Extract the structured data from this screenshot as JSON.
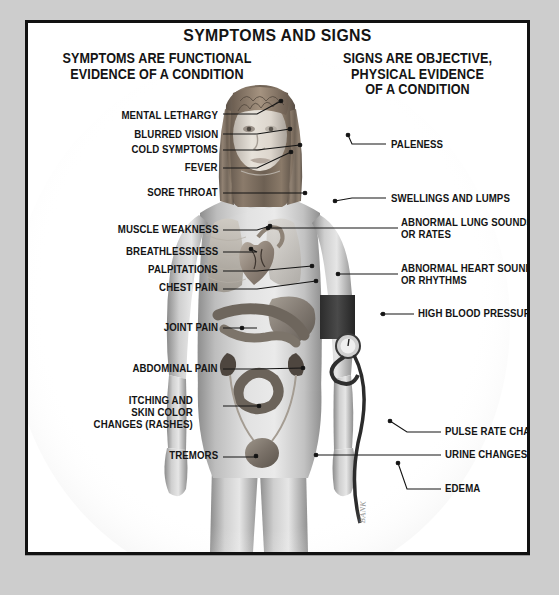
{
  "poster": {
    "title": "SYMPTOMS AND SIGNS",
    "heading_left": "SYMPTOMS ARE FUNCTIONAL\nEVIDENCE OF A CONDITION",
    "heading_right": "SIGNS ARE OBJECTIVE,\nPHYSICAL EVIDENCE\nOF A CONDITION",
    "signature": "BANK",
    "background_color": "#cdcdcd",
    "plate_color": "#ffffff",
    "frame_color": "#111111",
    "text_color": "#141414"
  },
  "symptoms": [
    {
      "label": "MENTAL LETHARGY",
      "x": 190,
      "y": 94,
      "lx": 195,
      "ly": 91,
      "tx": 253,
      "ty": 78
    },
    {
      "label": "BLURRED VISION",
      "x": 190,
      "y": 113,
      "lx": 195,
      "ly": 111,
      "tx": 262,
      "ty": 106
    },
    {
      "label": "COLD SYMPTOMS",
      "x": 190,
      "y": 128,
      "lx": 195,
      "ly": 127,
      "tx": 272,
      "ty": 122
    },
    {
      "label": "FEVER",
      "x": 190,
      "y": 146,
      "lx": 195,
      "ly": 145,
      "tx": 263,
      "ty": 129
    },
    {
      "label": "SORE THROAT",
      "x": 190,
      "y": 171,
      "lx": 195,
      "ly": 170,
      "tx": 277,
      "ty": 170
    },
    {
      "label": "MUSCLE WEAKNESS",
      "x": 190,
      "y": 208,
      "lx": 195,
      "ly": 207,
      "tx": 242,
      "ty": 203
    },
    {
      "label": "BREATHLESSNESS",
      "x": 190,
      "y": 230,
      "lx": 195,
      "ly": 229,
      "tx": 223,
      "ty": 226
    },
    {
      "label": "PALPITATIONS",
      "x": 190,
      "y": 248,
      "lx": 195,
      "ly": 248,
      "tx": 284,
      "ty": 243
    },
    {
      "label": "CHEST PAIN",
      "x": 190,
      "y": 266,
      "lx": 195,
      "ly": 266,
      "tx": 288,
      "ty": 258
    },
    {
      "label": "JOINT PAIN",
      "x": 190,
      "y": 306,
      "lx": 195,
      "ly": 305,
      "tx": 214,
      "ty": 305
    },
    {
      "label": "ABDOMINAL PAIN",
      "x": 190,
      "y": 347,
      "lx": 195,
      "ly": 346,
      "tx": 275,
      "ty": 345
    },
    {
      "label": "ITCHING AND\nSKIN COLOR\nCHANGES (RASHES)",
      "x": 165,
      "y": 379,
      "lx": 195,
      "ly": 383,
      "tx": 231,
      "ty": 383
    },
    {
      "label": "TREMORS",
      "x": 190,
      "y": 434,
      "lx": 195,
      "ly": 434,
      "tx": 228,
      "ty": 433
    }
  ],
  "signs": [
    {
      "label": "PALENESS",
      "x": 363,
      "y": 123,
      "lx": 358,
      "ly": 121,
      "tx": 320,
      "ty": 112
    },
    {
      "label": "SWELLINGS AND LUMPS",
      "x": 363,
      "y": 177,
      "lx": 358,
      "ly": 175,
      "tx": 307,
      "ty": 178
    },
    {
      "label": "ABNORMAL LUNG SOUNDS\nOR RATES",
      "x": 373,
      "y": 201,
      "lx": 370,
      "ly": 205,
      "tx": 240,
      "ty": 205
    },
    {
      "label": "ABNORMAL HEART SOUNDS\nOR RHYTHMS",
      "x": 373,
      "y": 247,
      "lx": 370,
      "ly": 251,
      "tx": 310,
      "ty": 251
    },
    {
      "label": "HIGH BLOOD PRESSURE",
      "x": 390,
      "y": 292,
      "lx": 386,
      "ly": 291,
      "tx": 355,
      "ty": 291
    },
    {
      "label": "PULSE RATE CHANGES",
      "x": 417,
      "y": 410,
      "lx": 413,
      "ly": 409,
      "tx": 362,
      "ty": 398
    },
    {
      "label": "URINE CHANGES",
      "x": 417,
      "y": 433,
      "lx": 413,
      "ly": 432,
      "tx": 288,
      "ty": 432
    },
    {
      "label": "EDEMA",
      "x": 417,
      "y": 467,
      "lx": 413,
      "ly": 466,
      "tx": 370,
      "ty": 440
    }
  ],
  "figure": {
    "organs": [
      "brain",
      "eye",
      "nose",
      "mouth",
      "throat",
      "lung",
      "heart",
      "stomach",
      "intestines",
      "kidney",
      "ureter",
      "bladder"
    ],
    "device": "blood-pressure-cuff"
  }
}
